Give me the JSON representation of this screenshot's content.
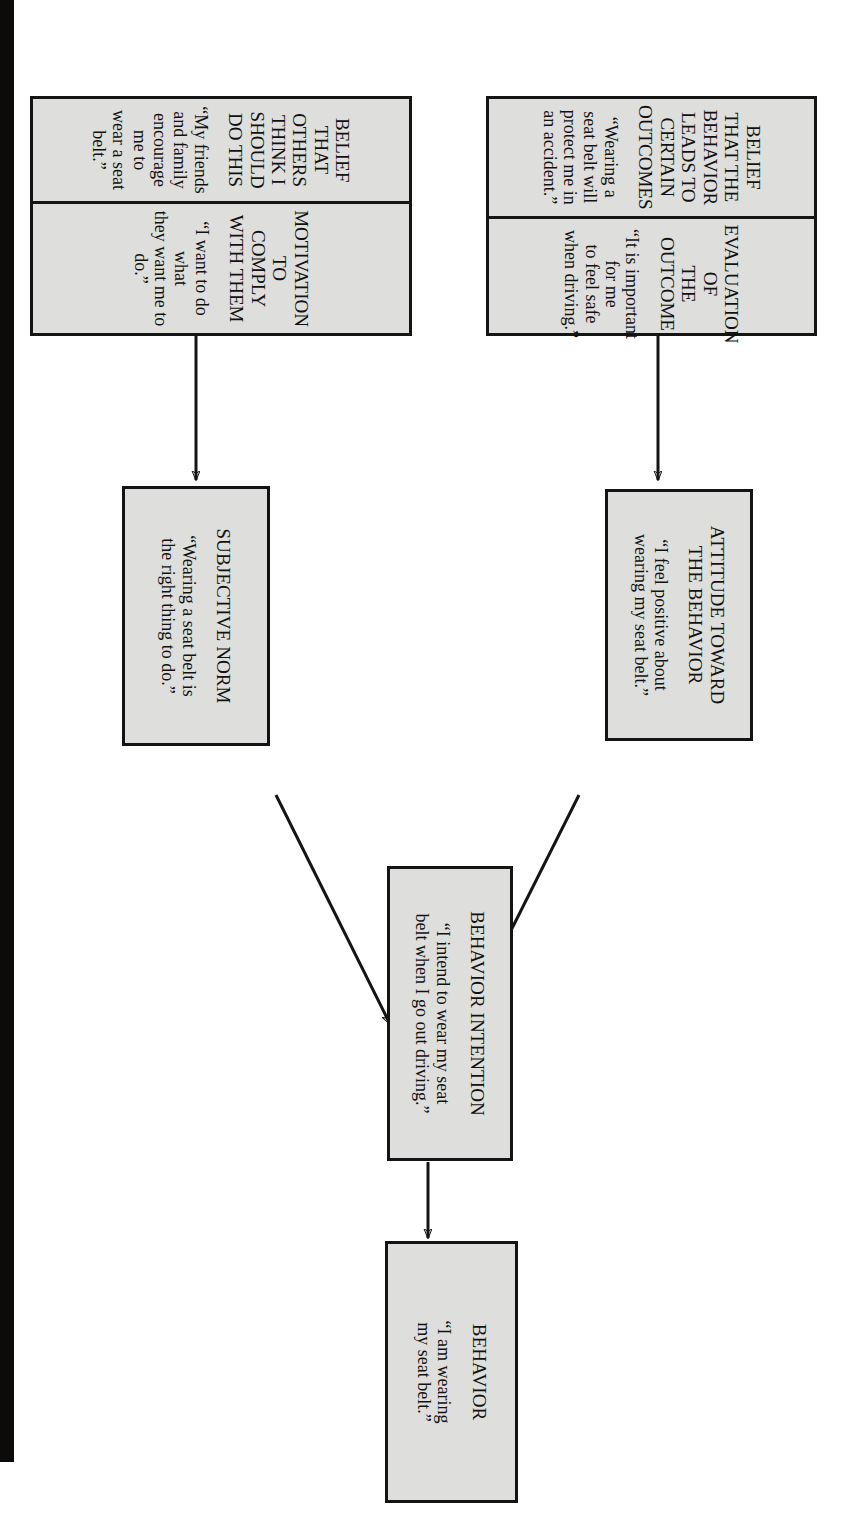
{
  "document": {
    "kind": "flow-diagram",
    "orientation": "rotated-90-clockwise",
    "page_background": "#ffffff",
    "node_fill": "#dededd",
    "node_stroke": "#141414",
    "scan_gutter_color": "#0d0b0a"
  },
  "nodes": {
    "behavior": {
      "title": "BEHAVIOR",
      "quote": "“I am wearing\nmy seat belt.”"
    },
    "behavior_intention": {
      "title": "BEHAVIOR INTENTION",
      "quote": "“I intend to wear my seat\nbelt when I go out driving.”"
    },
    "attitude": {
      "title": "ATTITUDE TOWARD\nTHE BEHAVIOR",
      "quote": "“I feel positive about\nwearing my seat belt.”"
    },
    "subjective_norm": {
      "title": "SUBJECTIVE NORM",
      "quote": "“Wearing a seat belt is\nthe right thing to do.”"
    },
    "belief_outcomes": {
      "title": "BELIEF THAT THE\nBEHAVIOR LEADS TO\nCERTAIN OUTCOMES",
      "quote": "“Wearing a seat belt will\nprotect me in an accident.”"
    },
    "evaluation_outcome": {
      "title": "EVALUATION OF\nTHE OUTCOME",
      "quote": "“It is important for me\nto feel safe when driving.”"
    },
    "belief_others": {
      "title": "BELIEF THAT OTHERS\nTHINK I SHOULD\nDO THIS",
      "quote": "“My friends and family\nencourage me to\nwear a seat belt.”"
    },
    "motivation_comply": {
      "title": "MOTIVATION TO\nCOMPLY WITH THEM",
      "quote": "“I want to do what\nthey want me to do.”"
    }
  },
  "connectors": [
    {
      "name": "intention-to-behavior",
      "from": "behavior_intention",
      "to": "behavior",
      "style": "straight-arrow"
    },
    {
      "name": "attitude-to-intention",
      "from": "attitude",
      "to": "behavior_intention",
      "style": "diagonal-arrow"
    },
    {
      "name": "norm-to-intention",
      "from": "subjective_norm",
      "to": "behavior_intention",
      "style": "diagonal-arrow"
    },
    {
      "name": "beliefs-to-attitude",
      "from": "belief_outcomes_group",
      "to": "attitude",
      "style": "straight-arrow"
    },
    {
      "name": "normative-beliefs-to-norm",
      "from": "belief_others_group",
      "to": "subjective_norm",
      "style": "straight-arrow"
    }
  ]
}
